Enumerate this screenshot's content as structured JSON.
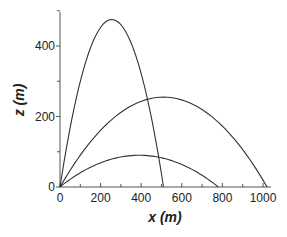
{
  "chart_data": {
    "type": "line",
    "title": "",
    "xlabel": "x (m)",
    "ylabel": "z (m)",
    "xlim": [
      0,
      1040
    ],
    "ylim": [
      0,
      500
    ],
    "x_ticks": [
      0,
      200,
      400,
      600,
      800,
      1000
    ],
    "y_ticks": [
      0,
      200,
      400
    ],
    "x_minor_step": 100,
    "y_minor_step": 100,
    "grid": false,
    "legend": null,
    "series": [
      {
        "name": "trajectory-high",
        "x": [
          0,
          51,
          102,
          153,
          204,
          255,
          306,
          357,
          408,
          459,
          510
        ],
        "y": [
          0,
          171,
          304,
          399,
          456,
          475,
          456,
          399,
          304,
          171,
          0
        ]
      },
      {
        "name": "trajectory-medium",
        "x": [
          0,
          102,
          204,
          306,
          408,
          510,
          612,
          714,
          816,
          918,
          1020
        ],
        "y": [
          0,
          92,
          163,
          214,
          245,
          255,
          245,
          214,
          163,
          92,
          0
        ]
      },
      {
        "name": "trajectory-low",
        "x": [
          0,
          78,
          156,
          234,
          312,
          390,
          468,
          546,
          624,
          702,
          780
        ],
        "y": [
          0,
          32,
          58,
          76,
          86,
          90,
          86,
          76,
          58,
          32,
          0
        ]
      }
    ]
  },
  "colors": {
    "line": "#333333",
    "axis": "#555555"
  }
}
